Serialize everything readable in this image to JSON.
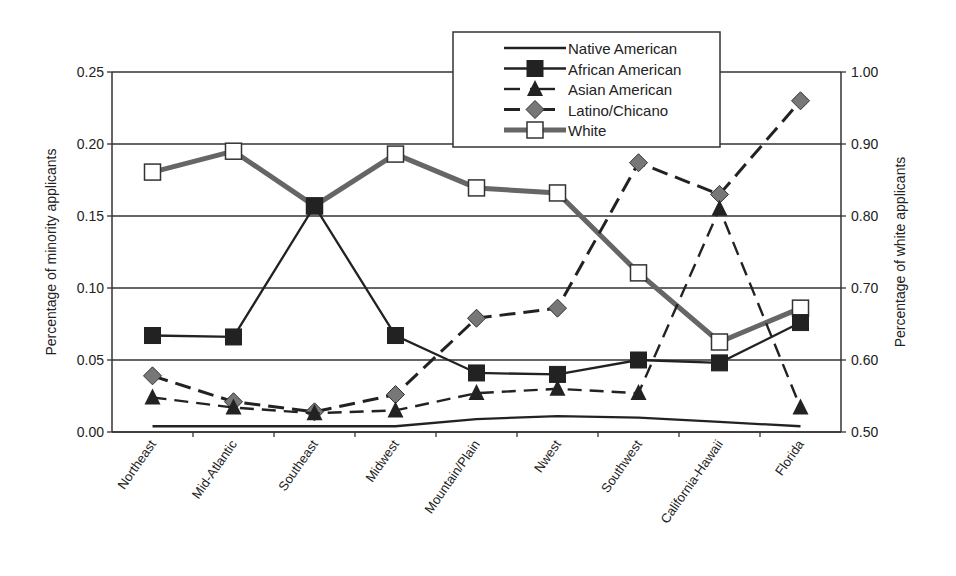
{
  "chart_data": {
    "type": "line",
    "title": "",
    "categories": [
      "Northeast",
      "Mid-Atlantic",
      "Southeast",
      "Midwest",
      "Mountain/Plain",
      "Nwest",
      "Southwest",
      "California-Hawaii",
      "Florida"
    ],
    "xlabel": "",
    "ylabel": "Percentage of minority applicants",
    "y2label": "Percentage of white applicants",
    "ylim": [
      0.0,
      0.25
    ],
    "y2lim": [
      0.5,
      1.0
    ],
    "yticks": [
      "0.00",
      "0.05",
      "0.10",
      "0.15",
      "0.20",
      "0.25"
    ],
    "y2ticks": [
      "0.50",
      "0.60",
      "0.70",
      "0.80",
      "0.90",
      "1.00"
    ],
    "grid": true,
    "legend_position": "top-right",
    "series": [
      {
        "name": "Native American",
        "axis": "left",
        "marker": "none",
        "dash": "solid",
        "color": "#222222",
        "values": [
          0.004,
          0.004,
          0.004,
          0.004,
          0.009,
          0.011,
          0.01,
          0.007,
          0.004
        ]
      },
      {
        "name": "African American",
        "axis": "left",
        "marker": "square-filled",
        "dash": "solid",
        "color": "#222222",
        "values": [
          0.067,
          0.066,
          0.157,
          0.067,
          0.041,
          0.04,
          0.05,
          0.048,
          0.076
        ]
      },
      {
        "name": "Asian American",
        "axis": "left",
        "marker": "triangle-filled",
        "dash": "dashed",
        "color": "#222222",
        "values": [
          0.024,
          0.017,
          0.013,
          0.015,
          0.027,
          0.03,
          0.027,
          0.155,
          0.017
        ]
      },
      {
        "name": "Latino/Chicano",
        "axis": "left",
        "marker": "diamond-gray",
        "dash": "dashed",
        "color": "#222222",
        "values": [
          0.039,
          0.021,
          0.014,
          0.026,
          0.079,
          0.086,
          0.187,
          0.165,
          0.23
        ]
      },
      {
        "name": "White",
        "axis": "right",
        "marker": "square-open",
        "dash": "solid",
        "color": "#666666",
        "values": [
          0.861,
          0.89,
          0.814,
          0.886,
          0.839,
          0.832,
          0.721,
          0.625,
          0.672
        ]
      }
    ]
  }
}
